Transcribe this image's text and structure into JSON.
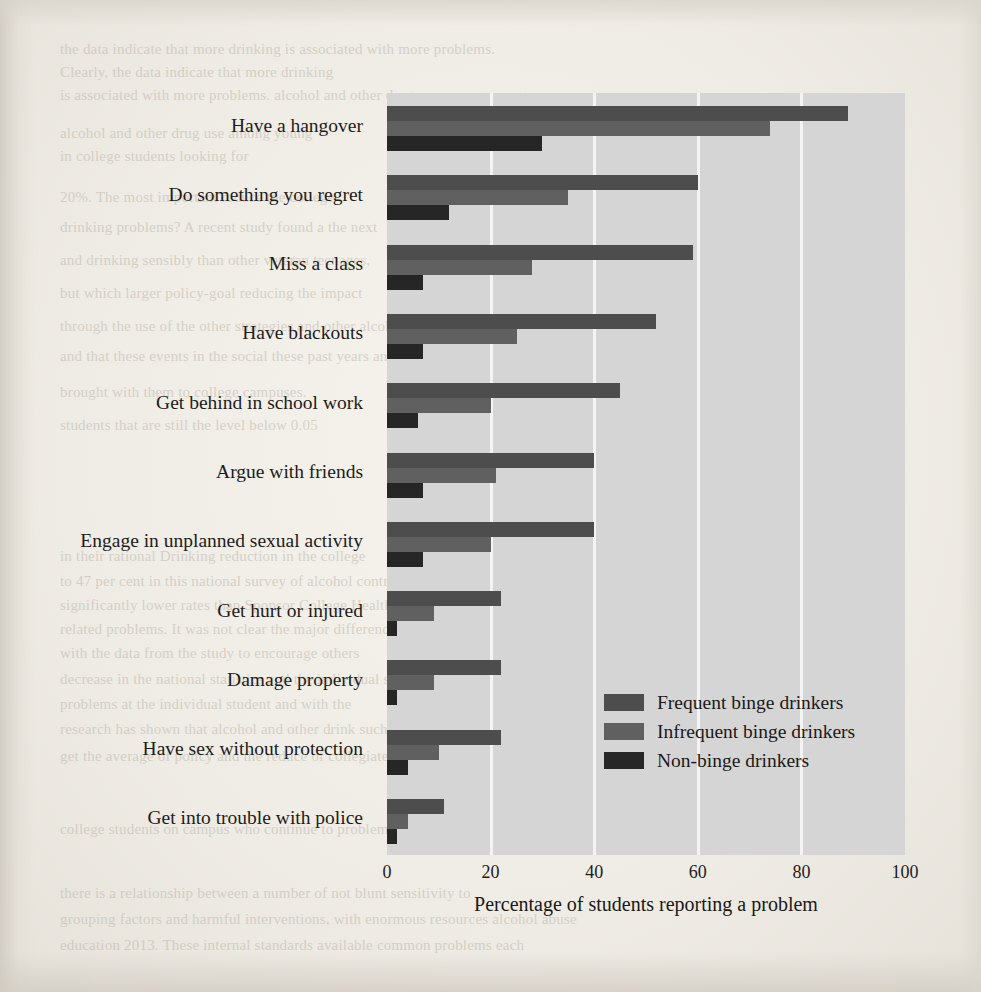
{
  "chart_data": {
    "type": "bar",
    "orientation": "horizontal",
    "title": "",
    "xlabel": "Percentage of students reporting a problem",
    "ylabel": "",
    "xlim": [
      0,
      100
    ],
    "xticks": [
      0,
      20,
      40,
      60,
      80,
      100
    ],
    "grid": "vertical-white-gridlines",
    "legend_position": "inside-lower-right",
    "plot_background": "#d5d5d5",
    "categories": [
      "Have a hangover",
      "Do something you regret",
      "Miss a class",
      "Have blackouts",
      "Get behind in school work",
      "Argue with friends",
      "Engage in unplanned sexual activity",
      "Get hurt or injured",
      "Damage property",
      "Have sex without protection",
      "Get into trouble with police"
    ],
    "series": [
      {
        "name": "Frequent binge drinkers",
        "color": "#4d4d4d",
        "values": [
          89,
          60,
          59,
          52,
          45,
          40,
          40,
          22,
          22,
          22,
          11
        ]
      },
      {
        "name": "Infrequent binge drinkers",
        "color": "#606060",
        "values": [
          74,
          35,
          28,
          25,
          20,
          21,
          20,
          9,
          9,
          10,
          4
        ]
      },
      {
        "name": "Non-binge drinkers",
        "color": "#262626",
        "values": [
          30,
          12,
          7,
          7,
          6,
          7,
          7,
          2,
          2,
          4,
          2
        ]
      }
    ]
  },
  "legend": {
    "entries": [
      {
        "label": "Frequent binge drinkers",
        "color": "#4d4d4d"
      },
      {
        "label": "Infrequent binge drinkers",
        "color": "#606060"
      },
      {
        "label": "Non-binge drinkers",
        "color": "#262626"
      }
    ]
  },
  "background_page_text": {
    "lines": [
      "the data indicate that more drinking",
      "Clearly, the data indicate that more drinking",
      "is associated with more problems.",
      "alcohol and other drug use among young",
      "In college students looking for",
      "what is the impact of these college",
      "problems? A recent study found a the next",
      "month, drinking sensibly than other veteran teenages,",
      "but which larger policy-goal reducing the impact",
      "of these campus problems is the cost",
      "through the use of the other strategies and other alcohol-related harm",
      "and that these events in the social these past years and those they have",
      "brought with them to college campuses."
    ]
  }
}
